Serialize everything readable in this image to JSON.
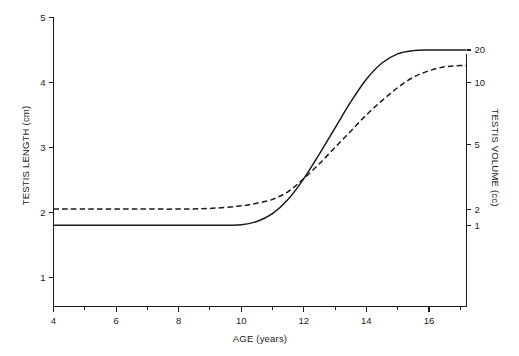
{
  "figure": {
    "background_color": "#ffffff",
    "line_color": "#1a1a1a"
  },
  "chart_data": {
    "type": "line",
    "title": "",
    "xlabel": "AGE (years)",
    "ylabel": "TESTIS LENGTH (cm)",
    "y2label": "TESTIS VOLUME (cc)",
    "grid": false,
    "legend": "none",
    "xlim": [
      4,
      17.2
    ],
    "ylim": [
      0.55,
      5
    ],
    "xticks": [
      4,
      6,
      8,
      10,
      12,
      14,
      16
    ],
    "xticklabels": [
      "4",
      "6",
      "8",
      "10",
      "12",
      "14",
      "16"
    ],
    "xminorticks": [
      5,
      7,
      9,
      11,
      13,
      15,
      17
    ],
    "yticks": [
      1,
      2,
      3,
      4,
      5
    ],
    "yticklabels": [
      "1",
      "2",
      "3",
      "4",
      "5"
    ],
    "y2_scale": "log",
    "y2ticks": [
      1,
      2,
      5,
      10,
      20
    ],
    "y2ticklabels": [
      "1",
      "2",
      "5",
      "10",
      "20"
    ],
    "y2tick_lengths_cm": [
      1.8,
      2.05,
      3.05,
      4.0,
      4.5
    ],
    "series": [
      {
        "name": "solid-curve",
        "style": "solid",
        "x": [
          4.0,
          5.0,
          6.0,
          7.0,
          8.0,
          9.0,
          10.0,
          10.5,
          11.0,
          11.5,
          12.0,
          12.5,
          13.0,
          13.5,
          14.0,
          14.5,
          15.0,
          15.5,
          16.0,
          16.5,
          17.0,
          17.2
        ],
        "y": [
          1.8,
          1.8,
          1.8,
          1.8,
          1.8,
          1.8,
          1.81,
          1.86,
          1.98,
          2.2,
          2.52,
          2.9,
          3.3,
          3.7,
          4.05,
          4.3,
          4.44,
          4.49,
          4.5,
          4.5,
          4.5,
          4.5
        ]
      },
      {
        "name": "dashed-curve",
        "style": "dashed",
        "x": [
          4.0,
          5.0,
          6.0,
          7.0,
          8.0,
          9.0,
          10.0,
          10.5,
          11.0,
          11.5,
          12.0,
          12.5,
          13.0,
          13.5,
          14.0,
          14.5,
          15.0,
          15.5,
          16.0,
          16.5,
          17.0,
          17.2
        ],
        "y": [
          2.05,
          2.05,
          2.05,
          2.05,
          2.05,
          2.06,
          2.1,
          2.14,
          2.2,
          2.32,
          2.52,
          2.75,
          3.0,
          3.25,
          3.5,
          3.72,
          3.92,
          4.08,
          4.18,
          4.24,
          4.26,
          4.26
        ]
      }
    ],
    "annotations": []
  }
}
